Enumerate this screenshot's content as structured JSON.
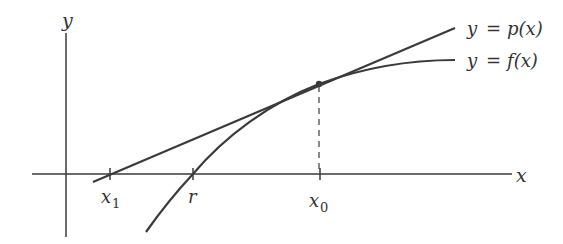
{
  "diagram": {
    "axes": {
      "x_label": "x",
      "y_label": "y"
    },
    "curves": [
      {
        "id": "tangent",
        "label_lhs": "y",
        "label_eq": "=",
        "label_rhs": "p(x)"
      },
      {
        "id": "function",
        "label_lhs": "y",
        "label_eq": "=",
        "label_rhs": "f(x)"
      }
    ],
    "ticks": [
      {
        "name": "x1",
        "main": "x",
        "sub": "1"
      },
      {
        "name": "r",
        "main": "r",
        "sub": ""
      },
      {
        "name": "x0",
        "main": "x",
        "sub": "0"
      }
    ],
    "colors": {
      "stroke": "#3a3a3a",
      "text": "#333333",
      "background": "#ffffff"
    }
  }
}
